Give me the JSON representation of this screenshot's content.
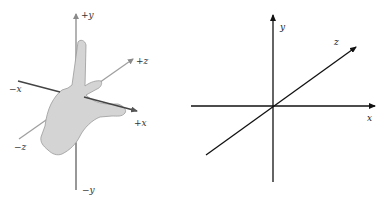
{
  "left_diagram": {
    "title": "Left-hand coordinate system",
    "labels": {
      "pos_y": "+y",
      "neg_y": "−y",
      "pos_x": "+x",
      "neg_x": "−x",
      "pos_z": "+z",
      "neg_z": "−z"
    },
    "colors": {
      "x_axis": "#444444",
      "y_axis": "#888888",
      "z_axis": "#999999",
      "hand_fill": "#d4d4d4",
      "hand_stroke": "#9a9a9a"
    }
  },
  "right_diagram": {
    "title": "3D axes",
    "labels": {
      "x": "x",
      "y": "y",
      "z": "z"
    },
    "colors": {
      "axes": "#111111"
    }
  }
}
